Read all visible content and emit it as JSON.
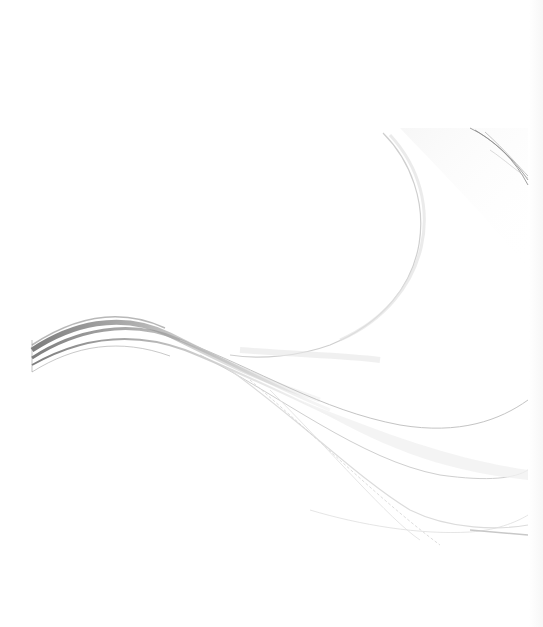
{
  "page": {
    "type": "cover-page-background",
    "colors": {
      "background": "#ffffff",
      "wave_dark": "#6e6e6e",
      "wave_mid": "#a8a8a8",
      "wave_light": "#d6d6d6",
      "wave_faint": "#ececec"
    }
  }
}
